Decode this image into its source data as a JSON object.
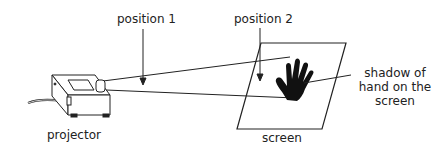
{
  "diagram": {
    "labels": {
      "position1": "position 1",
      "position2": "position 2",
      "projector": "projector",
      "screen": "screen",
      "shadow_line1": "shadow of",
      "shadow_line2": "hand on the",
      "shadow_line3": "screen"
    },
    "colors": {
      "stroke": "#222222",
      "fill": "#ffffff",
      "shadow": "#111111"
    }
  }
}
